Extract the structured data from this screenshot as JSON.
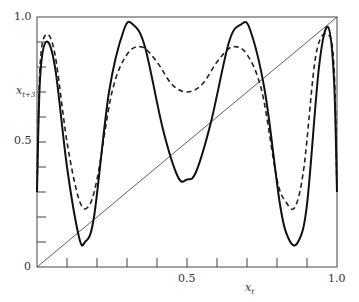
{
  "chart_data": {
    "type": "line",
    "title": "",
    "xlabel": "x_t",
    "ylabel": "x_{t+3}",
    "xlim": [
      0,
      1.0
    ],
    "ylim": [
      0,
      1.0
    ],
    "grid": false,
    "legend": "none",
    "x_tick_labels": [
      "0.5",
      "1.0"
    ],
    "y_tick_labels": [
      "0",
      "0.5",
      "1.0"
    ],
    "x_ticks_minor": [
      0.1,
      0.2,
      0.3,
      0.4,
      0.5,
      0.6,
      0.7,
      0.8,
      0.9
    ],
    "y_ticks_minor": [
      0.1,
      0.2,
      0.3,
      0.4,
      0.5,
      0.6,
      0.7,
      0.8,
      0.9
    ],
    "series": [
      {
        "name": "solid curve",
        "style": "solid",
        "x": [
          0.0,
          0.01,
          0.03,
          0.06,
          0.1,
          0.14,
          0.16,
          0.19,
          0.24,
          0.29,
          0.32,
          0.36,
          0.42,
          0.47,
          0.5,
          0.53,
          0.58,
          0.64,
          0.68,
          0.71,
          0.76,
          0.81,
          0.84,
          0.87,
          0.9,
          0.94,
          0.97,
          0.99,
          1.0
        ],
        "values": [
          0.3,
          0.75,
          0.9,
          0.8,
          0.4,
          0.12,
          0.1,
          0.2,
          0.7,
          0.95,
          0.97,
          0.88,
          0.55,
          0.36,
          0.35,
          0.38,
          0.58,
          0.9,
          0.97,
          0.95,
          0.7,
          0.25,
          0.11,
          0.1,
          0.25,
          0.8,
          0.96,
          0.75,
          0.3
        ]
      },
      {
        "name": "dashed curve",
        "style": "dashed",
        "x": [
          0.0,
          0.01,
          0.03,
          0.06,
          0.1,
          0.14,
          0.17,
          0.2,
          0.25,
          0.3,
          0.35,
          0.4,
          0.45,
          0.5,
          0.55,
          0.6,
          0.65,
          0.7,
          0.75,
          0.8,
          0.83,
          0.86,
          0.89,
          0.93,
          0.97,
          0.99,
          1.0
        ],
        "values": [
          0.3,
          0.8,
          0.93,
          0.85,
          0.5,
          0.27,
          0.24,
          0.35,
          0.7,
          0.85,
          0.88,
          0.82,
          0.73,
          0.7,
          0.73,
          0.82,
          0.88,
          0.85,
          0.7,
          0.35,
          0.26,
          0.24,
          0.4,
          0.85,
          0.93,
          0.8,
          0.3
        ]
      },
      {
        "name": "diagonal x_{t+3} = x_t",
        "style": "thin solid",
        "x": [
          0.0,
          1.0
        ],
        "values": [
          0.0,
          1.0
        ]
      }
    ]
  },
  "labels": {
    "y_top": "1.0",
    "y_mid": "0.5",
    "y_zero": "0",
    "x_mid": "0.5",
    "x_right": "1.0",
    "x_axis_var": "x",
    "x_axis_sub": "t",
    "y_axis_var": "x",
    "y_axis_sub": "t+3"
  }
}
